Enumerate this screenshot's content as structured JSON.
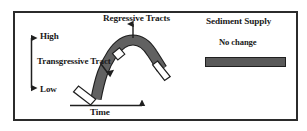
{
  "figure": {
    "type": "sea-level-curve-diagram",
    "background_color": "#ffffff",
    "frame_color": "#2b2b2b"
  },
  "left_panel": {
    "curve_label_top": "Regressive Tracts",
    "curve_label_mid": "Transgressive Tract",
    "y_axis": {
      "high_label": "High",
      "low_label": "Low"
    },
    "x_axis": {
      "label": "Time"
    },
    "curve": {
      "fill_color": "#616161",
      "stroke_color": "#1f1f1f",
      "segment_fill_color": "#ffffff"
    }
  },
  "right_panel": {
    "title": "Sediment Supply",
    "status": "No change",
    "bar_color": "#5a5a5a",
    "bar_border_color": "#1f1f1f"
  },
  "icons": {
    "up_arrow": "arrow-up-icon",
    "down_arrow": "arrow-down-icon",
    "right_arrow": "arrow-right-icon",
    "pointer_arrow": "arrow-pointer-icon"
  }
}
